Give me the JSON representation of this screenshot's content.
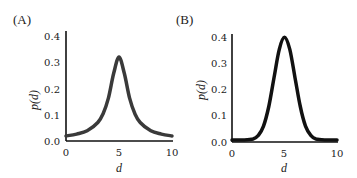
{
  "chart_data": [
    {
      "type": "line",
      "panel_label": "(A)",
      "title": "",
      "xlabel": "d",
      "ylabel": "p(d)",
      "xlim": [
        0,
        10
      ],
      "ylim": [
        0,
        0.4
      ],
      "xticks": [
        "0",
        "5",
        "10"
      ],
      "yticks": [
        "0.0",
        "0.1",
        "0.2",
        "0.3",
        "0.4"
      ],
      "grid": false,
      "legend": null,
      "line_color": "#3a3a3a",
      "description": "Cauchy/Lorentzian-shaped distribution centered at d=5, peak ~0.32",
      "series": [
        {
          "name": "p(d)",
          "x": [
            0,
            1,
            2,
            3,
            3.5,
            4,
            4.5,
            5,
            5.5,
            6,
            6.5,
            7,
            8,
            9,
            10
          ],
          "y": [
            0.012,
            0.019,
            0.032,
            0.064,
            0.098,
            0.159,
            0.255,
            0.318,
            0.255,
            0.159,
            0.098,
            0.064,
            0.032,
            0.019,
            0.012
          ]
        }
      ]
    },
    {
      "type": "line",
      "panel_label": "(B)",
      "title": "",
      "xlabel": "d",
      "ylabel": "p(d)",
      "xlim": [
        0,
        10
      ],
      "ylim": [
        0,
        0.4
      ],
      "xticks": [
        "0",
        "5",
        "10"
      ],
      "yticks": [
        "0.0",
        "0.1",
        "0.2",
        "0.3",
        "0.4"
      ],
      "grid": false,
      "legend": null,
      "line_color": "#111111",
      "description": "Gaussian distribution centered at d=5, sigma ~1, peak ~0.4",
      "series": [
        {
          "name": "p(d)",
          "x": [
            0,
            1,
            2,
            2.5,
            3,
            3.5,
            4,
            4.5,
            5,
            5.5,
            6,
            6.5,
            7,
            7.5,
            8,
            9,
            10
          ],
          "y": [
            0.0,
            0.0,
            0.004,
            0.018,
            0.054,
            0.13,
            0.242,
            0.352,
            0.399,
            0.352,
            0.242,
            0.13,
            0.054,
            0.018,
            0.004,
            0.0,
            0.0
          ]
        }
      ]
    }
  ]
}
